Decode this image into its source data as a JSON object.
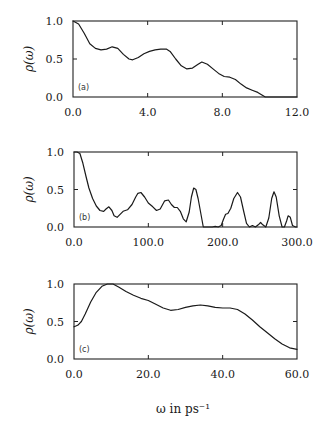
{
  "chart_data": [
    {
      "type": "line",
      "panel_label": "(a)",
      "ylabel": "ρ(ω)",
      "xlabel": "",
      "xlim": [
        0.0,
        12.0
      ],
      "ylim": [
        0.0,
        1.0
      ],
      "xticks": [
        0.0,
        4.0,
        8.0,
        12.0
      ],
      "xtick_labels": [
        "0.0",
        "4.0",
        "8.0",
        "12.0"
      ],
      "yticks": [
        0.0,
        0.5,
        1.0
      ],
      "ytick_labels": [
        "0.0",
        "0.5",
        "1.0"
      ],
      "grid": false,
      "series": [
        {
          "name": "rho",
          "x": [
            0.0,
            0.3,
            0.6,
            0.9,
            1.2,
            1.5,
            1.8,
            2.1,
            2.4,
            2.7,
            3.0,
            3.2,
            3.5,
            3.8,
            4.1,
            4.4,
            4.7,
            5.0,
            5.2,
            5.5,
            5.8,
            6.1,
            6.4,
            6.7,
            6.9,
            7.2,
            7.5,
            7.8,
            8.1,
            8.4,
            8.7,
            9.0,
            9.3,
            9.6,
            9.9,
            10.1,
            10.3,
            12.0
          ],
          "y": [
            1.0,
            0.96,
            0.84,
            0.7,
            0.64,
            0.62,
            0.63,
            0.66,
            0.64,
            0.56,
            0.5,
            0.49,
            0.52,
            0.57,
            0.6,
            0.62,
            0.63,
            0.63,
            0.6,
            0.5,
            0.41,
            0.37,
            0.38,
            0.43,
            0.46,
            0.43,
            0.37,
            0.31,
            0.27,
            0.26,
            0.23,
            0.17,
            0.12,
            0.09,
            0.06,
            0.03,
            0.0,
            0.0
          ]
        }
      ]
    },
    {
      "type": "line",
      "panel_label": "(b)",
      "ylabel": "ρ(ω)",
      "xlabel": "",
      "xlim": [
        0.0,
        300.0
      ],
      "ylim": [
        0.0,
        1.0
      ],
      "xticks": [
        0.0,
        100.0,
        200.0,
        300.0
      ],
      "xtick_labels": [
        "0.0",
        "100.0",
        "200.0",
        "300.0"
      ],
      "yticks": [
        0.0,
        0.5,
        1.0
      ],
      "ytick_labels": [
        "0.0",
        "0.5",
        "1.0"
      ],
      "grid": false,
      "series": [
        {
          "name": "rho",
          "x": [
            0,
            4,
            8,
            12,
            16,
            20,
            25,
            30,
            35,
            40,
            43,
            47,
            51,
            54,
            58,
            62,
            66,
            72,
            78,
            83,
            86,
            90,
            95,
            100,
            106,
            111,
            116,
            122,
            127,
            131,
            135,
            139,
            143,
            147,
            151,
            155,
            158,
            161,
            164,
            167,
            171,
            174,
            180,
            186,
            190,
            194,
            198,
            201,
            204,
            207,
            211,
            215,
            220,
            224,
            228,
            232,
            236,
            240,
            244,
            248,
            251,
            254,
            258,
            262,
            266,
            269,
            272,
            276,
            280,
            283,
            286,
            288,
            291,
            294,
            298,
            300
          ],
          "y": [
            1.0,
            1.0,
            0.98,
            0.85,
            0.68,
            0.52,
            0.38,
            0.28,
            0.22,
            0.21,
            0.24,
            0.27,
            0.22,
            0.15,
            0.13,
            0.17,
            0.21,
            0.23,
            0.3,
            0.4,
            0.45,
            0.46,
            0.4,
            0.32,
            0.27,
            0.22,
            0.24,
            0.35,
            0.36,
            0.3,
            0.26,
            0.26,
            0.21,
            0.11,
            0.07,
            0.2,
            0.4,
            0.52,
            0.5,
            0.38,
            0.16,
            0.0,
            0.0,
            0.0,
            0.01,
            0.0,
            0.02,
            0.1,
            0.17,
            0.18,
            0.25,
            0.38,
            0.46,
            0.4,
            0.22,
            0.05,
            0.0,
            0.02,
            0.0,
            0.03,
            0.06,
            0.03,
            0.0,
            0.12,
            0.38,
            0.47,
            0.4,
            0.15,
            0.0,
            0.0,
            0.08,
            0.15,
            0.13,
            0.02,
            0.0,
            0.0
          ]
        }
      ]
    },
    {
      "type": "line",
      "panel_label": "(c)",
      "ylabel": "ρ(ω)",
      "xlabel": "ω in ps⁻¹",
      "xlim": [
        0.0,
        60.0
      ],
      "ylim": [
        0.0,
        1.0
      ],
      "xticks": [
        0.0,
        20.0,
        40.0,
        60.0
      ],
      "xtick_labels": [
        "0.0",
        "20.0",
        "40.0",
        "60.0"
      ],
      "yticks": [
        0.0,
        0.5,
        1.0
      ],
      "ytick_labels": [
        "0.0",
        "0.5",
        "1.0"
      ],
      "grid": false,
      "series": [
        {
          "name": "rho",
          "x": [
            0.0,
            1.0,
            2.0,
            3.0,
            4.5,
            6.0,
            7.5,
            9.0,
            10.5,
            12.0,
            14.0,
            16.0,
            18.0,
            20.0,
            22.0,
            24.0,
            26.0,
            28.0,
            30.0,
            32.0,
            34.0,
            36.0,
            38.0,
            40.0,
            42.0,
            44.0,
            46.0,
            48.0,
            50.0,
            52.0,
            54.0,
            56.0,
            58.0,
            60.0
          ],
          "y": [
            0.43,
            0.45,
            0.5,
            0.6,
            0.76,
            0.89,
            0.97,
            1.0,
            1.0,
            0.96,
            0.9,
            0.85,
            0.81,
            0.78,
            0.73,
            0.68,
            0.65,
            0.66,
            0.69,
            0.71,
            0.72,
            0.71,
            0.69,
            0.68,
            0.68,
            0.66,
            0.6,
            0.52,
            0.43,
            0.35,
            0.27,
            0.2,
            0.15,
            0.13
          ]
        }
      ]
    }
  ]
}
